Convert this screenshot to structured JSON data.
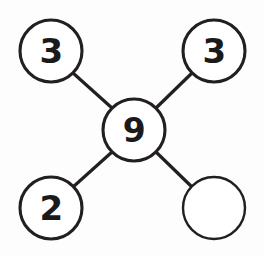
{
  "canvas": {
    "width": 264,
    "height": 257,
    "background_color": "#fdfdfd",
    "stroke_color": "#231f20",
    "text_color": "#1a1a1a"
  },
  "diagram": {
    "type": "node-link-star",
    "nodes": [
      {
        "id": "node-top-left",
        "name": "top-left-node",
        "label": "3",
        "cx": 51,
        "cy": 51,
        "r": 31,
        "filled": false,
        "empty": false,
        "stroke_weight": "normal"
      },
      {
        "id": "node-top-right",
        "name": "top-right-node",
        "label": "3",
        "cx": 214,
        "cy": 51,
        "r": 31,
        "filled": false,
        "empty": false,
        "stroke_weight": "normal"
      },
      {
        "id": "node-center",
        "name": "center-node",
        "label": "9",
        "cx": 134,
        "cy": 130,
        "r": 31,
        "filled": false,
        "empty": false,
        "stroke_weight": "normal"
      },
      {
        "id": "node-bottom-left",
        "name": "bottom-left-node",
        "label": "2",
        "cx": 51,
        "cy": 208,
        "r": 31,
        "filled": false,
        "empty": false,
        "stroke_weight": "normal"
      },
      {
        "id": "node-bottom-right",
        "name": "bottom-right-node",
        "label": "",
        "cx": 214,
        "cy": 208,
        "r": 31,
        "filled": false,
        "empty": true,
        "stroke_weight": "thin"
      }
    ],
    "edges": [
      {
        "id": "edge-center-top-left",
        "name": "edge-center-to-top-left",
        "from": "node-center",
        "to": "node-top-left",
        "x1": 112,
        "y1": 108,
        "x2": 73,
        "y2": 73
      },
      {
        "id": "edge-center-top-right",
        "name": "edge-center-to-top-right",
        "from": "node-center",
        "to": "node-top-right",
        "x1": 156,
        "y1": 108,
        "x2": 192,
        "y2": 73
      },
      {
        "id": "edge-center-bottom-left",
        "name": "edge-center-to-bottom-left",
        "from": "node-center",
        "to": "node-bottom-left",
        "x1": 112,
        "y1": 152,
        "x2": 73,
        "y2": 187
      },
      {
        "id": "edge-center-bottom-right",
        "name": "edge-center-to-bottom-right",
        "from": "node-center",
        "to": "node-bottom-right",
        "x1": 156,
        "y1": 152,
        "x2": 192,
        "y2": 187
      }
    ]
  }
}
